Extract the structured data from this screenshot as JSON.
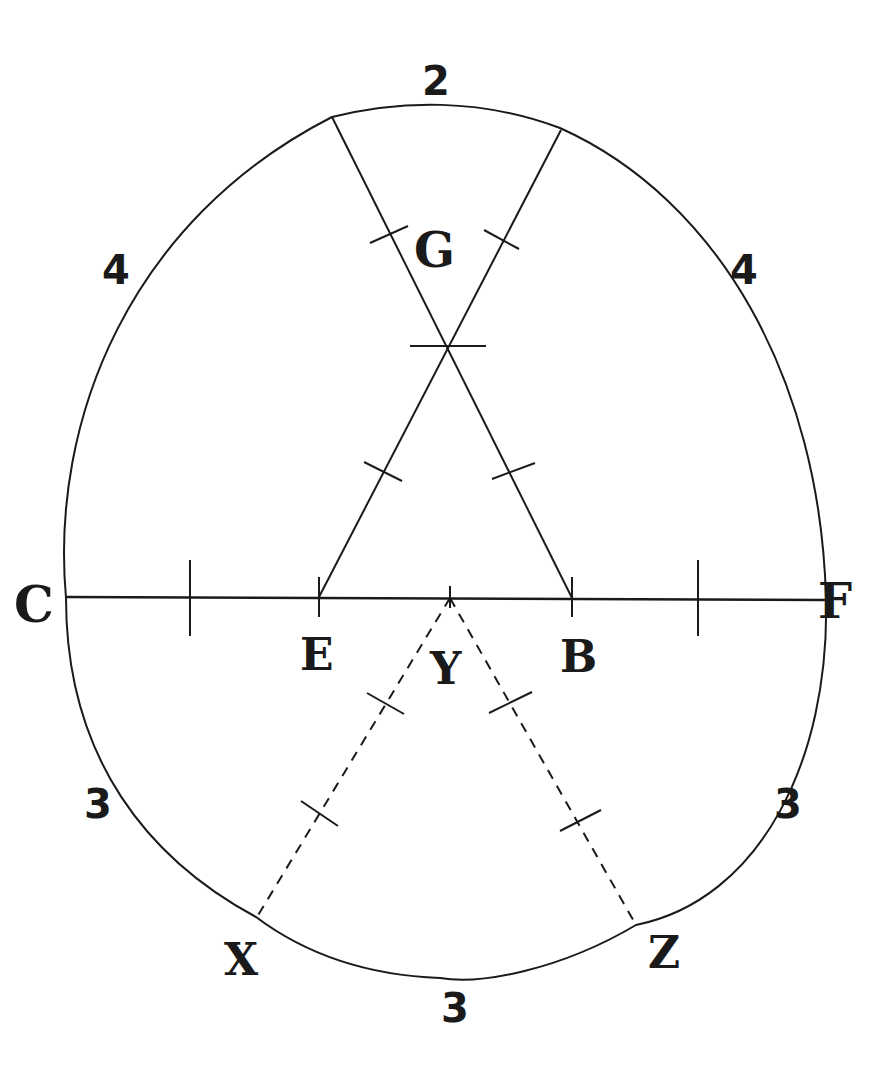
{
  "diagram": {
    "stroke_color": "#1a1a1a",
    "background": "#ffffff",
    "points": {
      "C": "C",
      "F": "F",
      "E": "E",
      "Y": "Y",
      "B": "B",
      "G": "G",
      "X": "X",
      "Z": "Z"
    },
    "arc_labels": {
      "top": "2",
      "upper_left": "4",
      "upper_right": "4",
      "lower_left": "3",
      "lower_right": "3",
      "bottom": "3"
    }
  }
}
